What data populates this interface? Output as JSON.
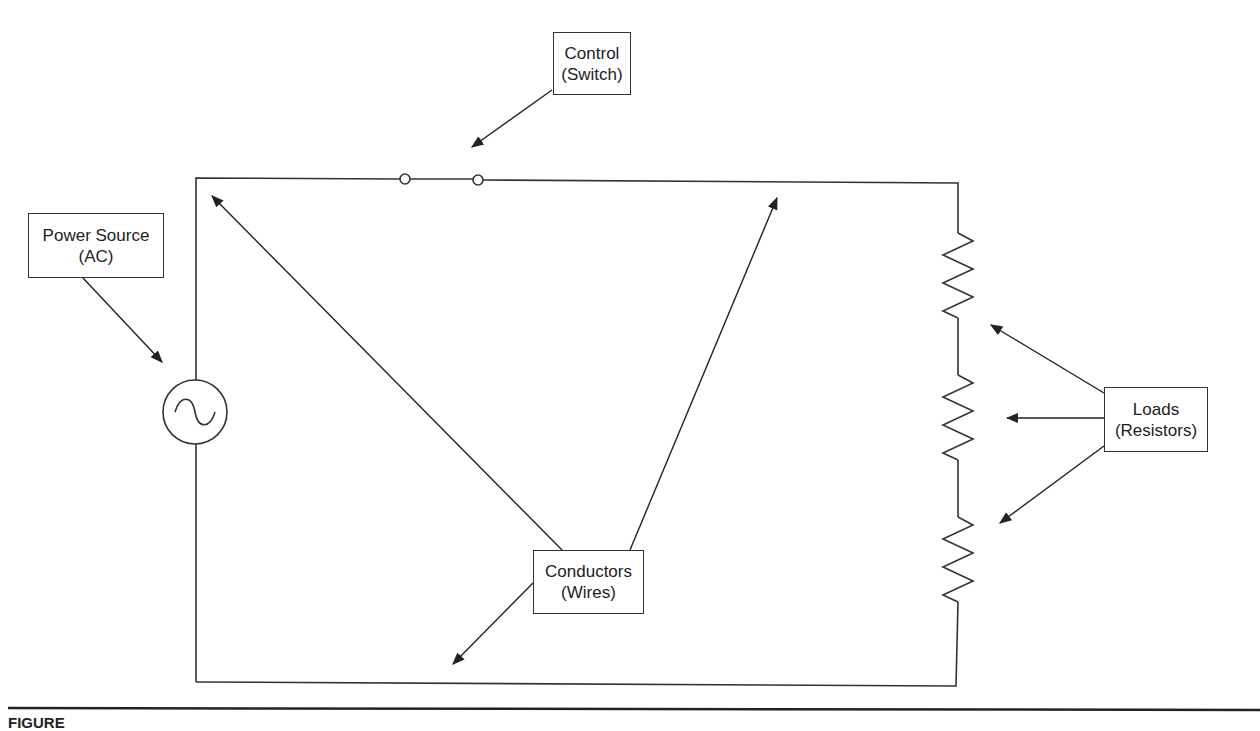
{
  "diagram": {
    "type": "series circuit schematic",
    "labels": {
      "control": {
        "line1": "Control",
        "line2": "(Switch)"
      },
      "power_source": {
        "line1": "Power Source",
        "line2": "(AC)"
      },
      "conductors": {
        "line1": "Conductors",
        "line2": "(Wires)"
      },
      "loads": {
        "line1": "Loads",
        "line2": "(Resistors)"
      }
    },
    "components": [
      {
        "id": "ac-source",
        "symbol": "circle with sine wave"
      },
      {
        "id": "switch",
        "symbol": "two open contacts"
      },
      {
        "id": "resistor-1",
        "symbol": "zigzag"
      },
      {
        "id": "resistor-2",
        "symbol": "zigzag"
      },
      {
        "id": "resistor-3",
        "symbol": "zigzag"
      }
    ],
    "colors": {
      "line": "#333333",
      "background": "#ffffff"
    }
  },
  "caption": {
    "text": "FIGURE"
  }
}
